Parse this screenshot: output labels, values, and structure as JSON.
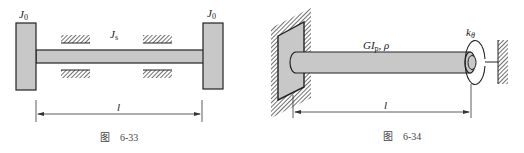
{
  "figure_33": {
    "label_left_disk": "J",
    "label_left_disk_sub": "0",
    "label_right_disk": "J",
    "label_right_disk_sub": "0",
    "label_shaft": "J",
    "label_shaft_sub": "s",
    "label_length": "l",
    "caption_prefix": "图",
    "caption_number": "6-33"
  },
  "figure_34": {
    "label_shaft": "GI",
    "label_shaft_sub": "p",
    "label_shaft_suffix": ", ρ",
    "label_spring": "k",
    "label_spring_sub": "θ",
    "label_length": "l",
    "caption_prefix": "图",
    "caption_number": "6-34"
  },
  "colors": {
    "fill_gray": "#c8c8c8",
    "stroke": "#222222",
    "caption": "#444444"
  }
}
